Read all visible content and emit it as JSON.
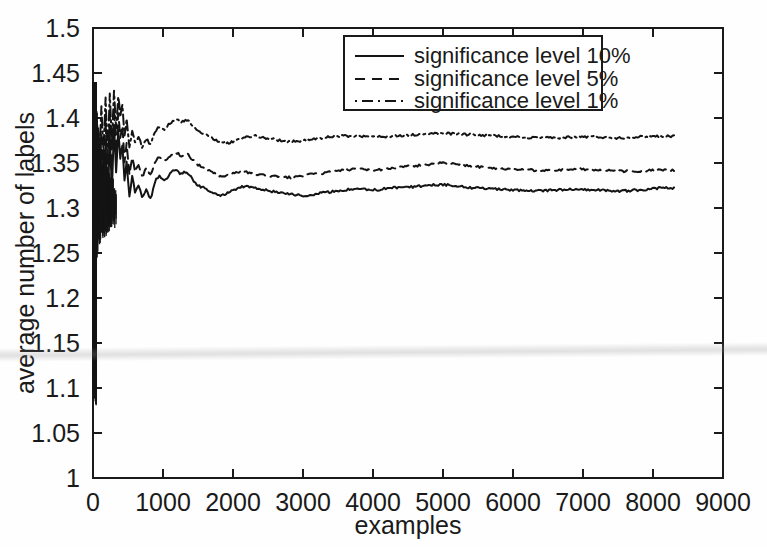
{
  "chart_data": {
    "type": "line",
    "title": "",
    "xlabel": "examples",
    "ylabel": "average number of labels",
    "xlim": [
      0,
      9000
    ],
    "ylim": [
      1,
      1.5
    ],
    "xticks": [
      0,
      1000,
      2000,
      3000,
      4000,
      5000,
      6000,
      7000,
      8000,
      9000
    ],
    "xtick_labels": [
      "0",
      "1000",
      "2000",
      "3000",
      "4000",
      "5000",
      "6000",
      "7000",
      "8000",
      "9000"
    ],
    "yticks": [
      1,
      1.05,
      1.1,
      1.15,
      1.2,
      1.25,
      1.3,
      1.35,
      1.4,
      1.45,
      1.5
    ],
    "ytick_labels": [
      "1",
      "1.05",
      "1.1",
      "1.15",
      "1.2",
      "1.25",
      "1.3",
      "1.35",
      "1.4",
      "1.45",
      "1.5"
    ],
    "grid": false,
    "legend_position": "top-center-right",
    "legend_entries": [
      {
        "label": "significance level 10%",
        "dash": "solid"
      },
      {
        "label": "significance level 5%",
        "dash": "dashed"
      },
      {
        "label": "significance level 1%",
        "dash": "dashdot"
      }
    ],
    "series": [
      {
        "name": "significance level 10%",
        "dash": "solid",
        "x": [
          30,
          60,
          90,
          120,
          150,
          180,
          210,
          240,
          270,
          300,
          330,
          360,
          390,
          420,
          450,
          480,
          520,
          560,
          600,
          650,
          700,
          760,
          820,
          880,
          950,
          1020,
          1100,
          1180,
          1260,
          1340,
          1420,
          1500,
          1600,
          1700,
          1800,
          1900,
          2000,
          2150,
          2300,
          2450,
          2600,
          2800,
          3000,
          3200,
          3400,
          3600,
          3800,
          4000,
          4250,
          4500,
          4750,
          5000,
          5250,
          5500,
          5750,
          6000,
          6300,
          6600,
          6900,
          7200,
          7500,
          7800,
          8100,
          8300
        ],
        "y": [
          1.173,
          1.325,
          1.29,
          1.36,
          1.31,
          1.372,
          1.3,
          1.38,
          1.32,
          1.392,
          1.34,
          1.386,
          1.355,
          1.37,
          1.33,
          1.352,
          1.312,
          1.336,
          1.318,
          1.326,
          1.312,
          1.32,
          1.31,
          1.328,
          1.335,
          1.33,
          1.338,
          1.342,
          1.338,
          1.34,
          1.332,
          1.325,
          1.322,
          1.318,
          1.314,
          1.316,
          1.32,
          1.324,
          1.322,
          1.32,
          1.318,
          1.316,
          1.314,
          1.316,
          1.318,
          1.32,
          1.321,
          1.32,
          1.322,
          1.323,
          1.325,
          1.326,
          1.324,
          1.322,
          1.321,
          1.32,
          1.319,
          1.32,
          1.321,
          1.32,
          1.319,
          1.32,
          1.322,
          1.322
        ]
      },
      {
        "name": "significance level 5%",
        "dash": "dashed",
        "x": [
          30,
          60,
          90,
          120,
          150,
          180,
          210,
          240,
          270,
          300,
          330,
          360,
          390,
          420,
          450,
          480,
          520,
          560,
          600,
          650,
          700,
          760,
          820,
          880,
          950,
          1020,
          1100,
          1180,
          1260,
          1340,
          1420,
          1500,
          1600,
          1700,
          1800,
          1900,
          2000,
          2150,
          2300,
          2450,
          2600,
          2800,
          3000,
          3200,
          3400,
          3600,
          3800,
          4000,
          4250,
          4500,
          4750,
          5000,
          5250,
          5500,
          5750,
          6000,
          6300,
          6600,
          6900,
          7200,
          7500,
          7800,
          8100,
          8300
        ],
        "y": [
          1.2,
          1.35,
          1.318,
          1.385,
          1.335,
          1.398,
          1.33,
          1.405,
          1.345,
          1.412,
          1.362,
          1.404,
          1.378,
          1.392,
          1.352,
          1.372,
          1.338,
          1.356,
          1.34,
          1.348,
          1.336,
          1.344,
          1.338,
          1.35,
          1.356,
          1.352,
          1.358,
          1.362,
          1.358,
          1.36,
          1.354,
          1.348,
          1.344,
          1.34,
          1.336,
          1.336,
          1.338,
          1.34,
          1.338,
          1.336,
          1.335,
          1.334,
          1.336,
          1.338,
          1.34,
          1.342,
          1.343,
          1.342,
          1.344,
          1.346,
          1.348,
          1.35,
          1.348,
          1.346,
          1.344,
          1.343,
          1.342,
          1.342,
          1.343,
          1.342,
          1.341,
          1.341,
          1.342,
          1.342
        ]
      },
      {
        "name": "significance level 1%",
        "dash": "dashdot",
        "x": [
          30,
          60,
          90,
          120,
          150,
          180,
          210,
          240,
          270,
          300,
          330,
          360,
          390,
          420,
          450,
          480,
          520,
          560,
          600,
          650,
          700,
          760,
          820,
          880,
          950,
          1020,
          1100,
          1180,
          1260,
          1340,
          1420,
          1500,
          1600,
          1700,
          1800,
          1900,
          2000,
          2150,
          2300,
          2450,
          2600,
          2800,
          3000,
          3200,
          3400,
          3600,
          3800,
          4000,
          4250,
          4500,
          4750,
          5000,
          5250,
          5500,
          5750,
          6000,
          6300,
          6600,
          6900,
          7200,
          7500,
          7800,
          8100,
          8300
        ],
        "y": [
          1.238,
          1.382,
          1.35,
          1.412,
          1.362,
          1.422,
          1.358,
          1.428,
          1.372,
          1.43,
          1.388,
          1.424,
          1.402,
          1.415,
          1.38,
          1.398,
          1.368,
          1.386,
          1.372,
          1.38,
          1.368,
          1.376,
          1.372,
          1.384,
          1.39,
          1.388,
          1.394,
          1.398,
          1.396,
          1.398,
          1.392,
          1.386,
          1.382,
          1.378,
          1.374,
          1.372,
          1.374,
          1.378,
          1.38,
          1.378,
          1.376,
          1.374,
          1.375,
          1.377,
          1.379,
          1.38,
          1.38,
          1.379,
          1.38,
          1.381,
          1.382,
          1.383,
          1.382,
          1.381,
          1.38,
          1.379,
          1.378,
          1.378,
          1.379,
          1.379,
          1.378,
          1.379,
          1.38,
          1.38
        ]
      }
    ],
    "noise_band": {
      "x_start": 5,
      "x_end": 330,
      "description": "dense oscillating transient at the left edge of the plot"
    },
    "colors": {
      "line": "#141414",
      "axis": "#1a1a1a",
      "background": "#fefefe"
    }
  }
}
